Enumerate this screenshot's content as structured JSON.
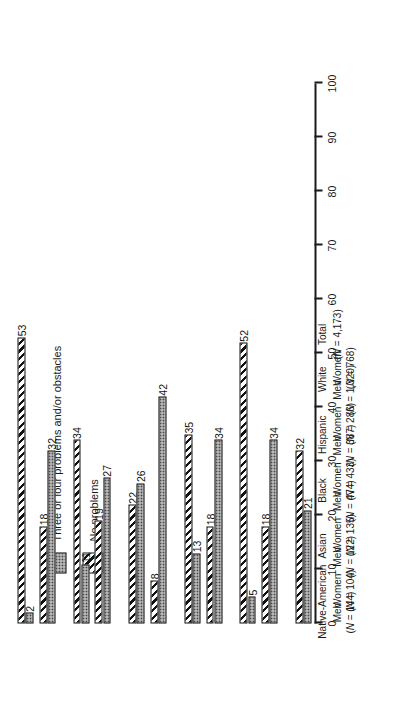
{
  "chart_data": {
    "type": "bar",
    "title": "",
    "xlabel": "",
    "ylabel": "",
    "orientation": "vertical-rendered-rotated",
    "ylim": [
      0,
      100
    ],
    "y_ticks": [
      0,
      10,
      20,
      30,
      40,
      50,
      60,
      70,
      80,
      90,
      100
    ],
    "grid": false,
    "legend_position": "upper-left",
    "categories": [
      "Native-American Men",
      "Native-American Women",
      "Asian Men",
      "Asian Women",
      "Black Men",
      "Black Women",
      "Hispanic Men",
      "Hispanic Women",
      "White Men",
      "White Women",
      "Total"
    ],
    "groups": [
      {
        "major": "Native-American",
        "members": [
          {
            "sex": "Men",
            "n_label": "(N = 144)",
            "n": 144
          },
          {
            "sex": "Women",
            "n_label": "(N = 104)",
            "n": 104
          }
        ]
      },
      {
        "major": "Asian",
        "members": [
          {
            "sex": "Men",
            "n_label": "(N = 122)",
            "n": 122
          },
          {
            "sex": "Women",
            "n_label": "(N = 135)",
            "n": 135
          }
        ]
      },
      {
        "major": "Black",
        "members": [
          {
            "sex": "Men",
            "n_label": "(N = 474)",
            "n": 474
          },
          {
            "sex": "Women",
            "n_label": "(N = 433)",
            "n": 433
          }
        ]
      },
      {
        "major": "Hispanic",
        "members": [
          {
            "sex": "Men",
            "n_label": "(N = 387)",
            "n": 387
          },
          {
            "sex": "Women",
            "n_label": "(N = 286)",
            "n": 286
          }
        ]
      },
      {
        "major": "White",
        "members": [
          {
            "sex": "Men",
            "n_label": "(N = 1,320)",
            "n": 1320
          },
          {
            "sex": "Women",
            "n_label": "(N = 768)",
            "n": 768
          }
        ]
      },
      {
        "major": "Total",
        "members": [
          {
            "sex": "",
            "n_label": "(N = 4,173)",
            "n": 4173
          }
        ]
      }
    ],
    "series": [
      {
        "name": "No problems",
        "pattern": "hatched",
        "values": [
          53,
          18,
          34,
          19,
          22,
          8,
          35,
          18,
          52,
          18,
          32
        ]
      },
      {
        "name": "Three or four problems and/or obstacles",
        "pattern": "dotted",
        "values": [
          2,
          32,
          11,
          27,
          26,
          42,
          13,
          34,
          5,
          34,
          21
        ]
      }
    ]
  },
  "legend": {
    "entries": [
      {
        "label": "Three or four problems and/or obstacles",
        "pattern": "dotted"
      },
      {
        "label": "No problems",
        "pattern": "hatched"
      }
    ]
  },
  "axis": {
    "tick_labels": [
      "0",
      "10",
      "20",
      "30",
      "40",
      "50",
      "60",
      "70",
      "80",
      "90",
      "100"
    ]
  },
  "colors": {
    "ink": "#111111",
    "dotted_fill": "#d9d9d9",
    "hatch": "#121212",
    "background": "#ffffff"
  }
}
